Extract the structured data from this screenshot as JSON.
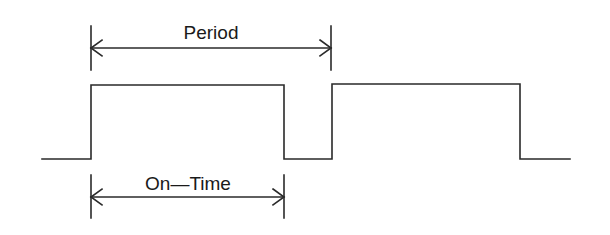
{
  "diagram": {
    "color": "#2a2a2a",
    "labels": {
      "period": "Period",
      "on_time": "On—Time"
    },
    "waveform": {
      "low_y": 159,
      "high_y": 85,
      "points": [
        [
          42,
          159
        ],
        [
          91,
          159
        ],
        [
          91,
          85
        ],
        [
          284,
          85
        ],
        [
          284,
          159
        ],
        [
          332,
          159
        ],
        [
          332,
          84
        ],
        [
          520,
          84
        ],
        [
          520,
          159
        ],
        [
          570,
          159
        ]
      ]
    },
    "dimensions": [
      {
        "name": "period",
        "x1": 91,
        "x2": 331,
        "y": 48,
        "tick_top": 26,
        "tick_bottom": 70,
        "label_x": 211,
        "label_y": 39
      },
      {
        "name": "on_time",
        "x1": 91,
        "x2": 284,
        "y": 197,
        "tick_top": 175,
        "tick_bottom": 218,
        "label_x": 188,
        "label_y": 190
      }
    ]
  }
}
